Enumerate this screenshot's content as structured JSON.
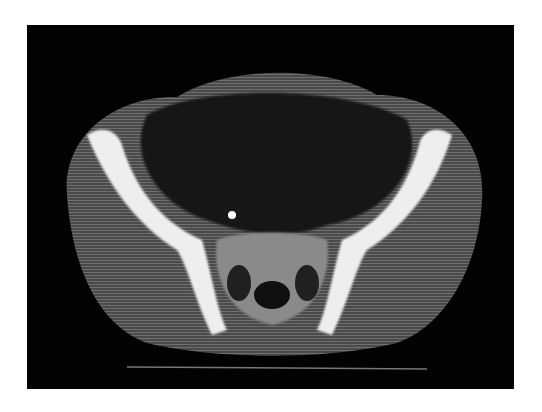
{
  "image": {
    "subject": "axial CT scan of the pelvis",
    "background_color": "#ffffff",
    "scan_background": "#020202",
    "bone_color": "#f2f2f2",
    "soft_tissue_color": "#5a5a5a"
  }
}
